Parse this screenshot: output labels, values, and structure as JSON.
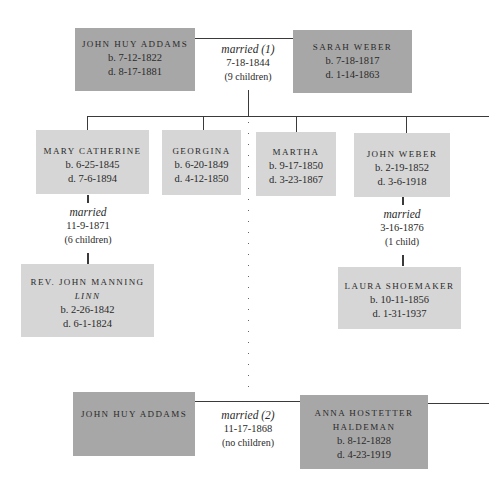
{
  "marriage1": {
    "husband": {
      "name": "John Huy Addams",
      "born": "b. 7-12-1822",
      "died": "d. 8-17-1881"
    },
    "wife": {
      "name": "Sarah Weber",
      "born": "b. 7-18-1817",
      "died": "d. 1-14-1863"
    },
    "label": "married (1)",
    "date": "7-18-1844",
    "children_count": "(9 children)"
  },
  "children": [
    {
      "name": "Mary Catherine",
      "born": "b. 6-25-1845",
      "died": "d. 7-6-1894"
    },
    {
      "name": "Georgina",
      "born": "b. 6-20-1849",
      "died": "d. 4-12-1850"
    },
    {
      "name": "Martha",
      "born": "b. 9-17-1850",
      "died": "d. 3-23-1867"
    },
    {
      "name": "John Weber",
      "born": "b. 2-19-1852",
      "died": "d. 3-6-1918"
    }
  ],
  "child_marriages": [
    {
      "label": "married",
      "date": "11-9-1871",
      "children_count": "(6 children)",
      "spouse": {
        "name": "Rev. John Manning",
        "name2": "Linn",
        "born": "b. 2-26-1842",
        "died": "d. 6-1-1824"
      }
    },
    {
      "label": "married",
      "date": "3-16-1876",
      "children_count": "(1 child)",
      "spouse": {
        "name": "Laura Shoemaker",
        "born": "b. 10-11-1856",
        "died": "d. 1-31-1937"
      }
    }
  ],
  "marriage2": {
    "husband": {
      "name": "John Huy Addams"
    },
    "wife": {
      "name": "Anna Hostetter",
      "name2": "Haldeman",
      "born": "b. 8-12-1828",
      "died": "d. 4-23-1919"
    },
    "label": "married (2)",
    "date": "11-17-1868",
    "children_count": "(no children)"
  }
}
